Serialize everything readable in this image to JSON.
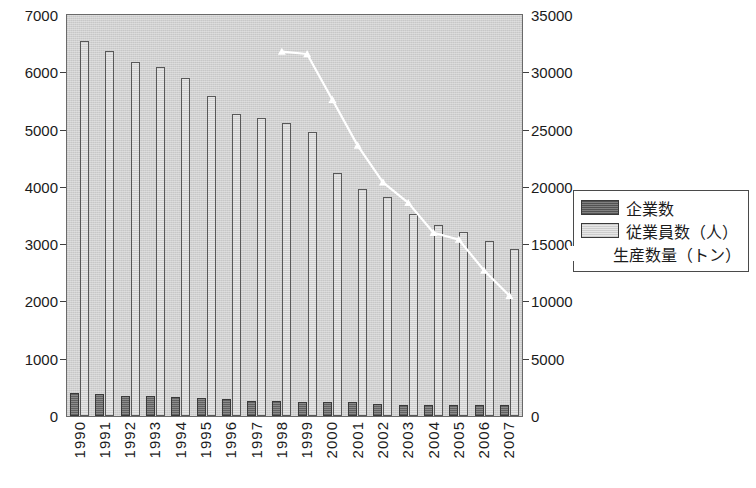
{
  "chart_data": {
    "type": "bar",
    "title": "",
    "subtitle": "",
    "xlabel": "",
    "ylabel": "",
    "grid": false,
    "legend_position": "right",
    "categories": [
      "1990",
      "1991",
      "1992",
      "1993",
      "1994",
      "1995",
      "1996",
      "1997",
      "1998",
      "1999",
      "2000",
      "2001",
      "2002",
      "2003",
      "2004",
      "2005",
      "2006",
      "2007"
    ],
    "axes": {
      "left": {
        "label": "",
        "min": 0,
        "max": 7000,
        "ticks": [
          0,
          1000,
          2000,
          3000,
          4000,
          5000,
          6000,
          7000
        ],
        "tick_labels": [
          "0",
          "1000",
          "2000",
          "3000",
          "4000",
          "5000",
          "6000",
          "7000"
        ]
      },
      "right": {
        "label": "",
        "min": 0,
        "max": 35000,
        "ticks": [
          0,
          5000,
          10000,
          15000,
          20000,
          25000,
          30000,
          35000
        ],
        "tick_labels": [
          "0",
          "5000",
          "10000",
          "15000",
          "20000",
          "25000",
          "30000",
          "35000"
        ]
      }
    },
    "series": [
      {
        "name": "企業数",
        "kind": "bar",
        "axis": "left",
        "color": "#7b7b7b",
        "values": [
          400,
          390,
          355,
          345,
          330,
          320,
          290,
          265,
          265,
          250,
          245,
          240,
          215,
          195,
          190,
          190,
          190,
          185
        ]
      },
      {
        "name": "従業員数（人）",
        "kind": "bar",
        "axis": "left",
        "color": "#dcdcdc",
        "values": [
          6550,
          6380,
          6180,
          6090,
          5900,
          5580,
          5280,
          5210,
          5120,
          4950,
          4240,
          3960,
          3820,
          3530,
          3340,
          3220,
          3050,
          2910
        ]
      },
      {
        "name": "生産数量（トン）",
        "kind": "line",
        "axis": "right",
        "color": "#ffffff",
        "values": [
          null,
          null,
          null,
          null,
          null,
          null,
          null,
          null,
          31800,
          31600,
          27600,
          23600,
          20400,
          18600,
          16000,
          15400,
          12700,
          10500
        ]
      }
    ]
  },
  "legend": {
    "entries": [
      {
        "label": "企業数",
        "swatch": "dark"
      },
      {
        "label": "従業員数（人）",
        "swatch": "light"
      },
      {
        "label": "生産数量（トン）",
        "swatch": "blank"
      }
    ]
  }
}
